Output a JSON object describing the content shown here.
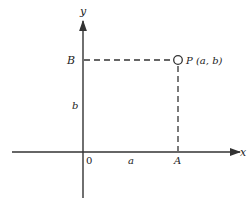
{
  "diagram": {
    "colors": {
      "ink": "#333333",
      "background": "#ffffff"
    },
    "axes": {
      "x_label": "x",
      "y_label": "y",
      "origin_label": "0"
    },
    "point": {
      "label": "P (a, b)",
      "marker": "open-circle"
    },
    "projections": {
      "x_foot_label": "A",
      "y_foot_label": "B",
      "x_distance_label": "a",
      "y_distance_label": "b",
      "style": "dashed"
    }
  }
}
